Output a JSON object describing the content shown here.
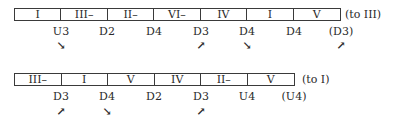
{
  "rows": [
    {
      "cells": [
        "I",
        "III–",
        "II–",
        "VI–",
        "IV",
        "I",
        "V"
      ],
      "target": "(to III)",
      "labels": [
        "U3",
        "D2",
        "D4",
        "D3",
        "D4",
        "D4",
        "(D3)"
      ],
      "arrows": [
        "↘",
        "",
        "",
        "↗",
        "↘",
        "",
        "↗"
      ]
    },
    {
      "cells": [
        "III–",
        "I",
        "V",
        "IV",
        "II–",
        "V"
      ],
      "target": "(to I)",
      "labels": [
        "D3",
        "D4",
        "D2",
        "D3",
        "U4",
        "(U4)"
      ],
      "arrows": [
        "↗",
        "↘",
        "",
        "↗",
        "",
        ""
      ]
    }
  ]
}
